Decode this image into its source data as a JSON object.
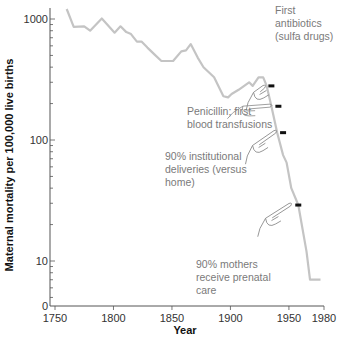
{
  "chart_data": {
    "type": "line",
    "title": "",
    "xlabel": "Year",
    "ylabel": "Maternal mortality per 100,000 live births",
    "yscale": "log",
    "xlim": [
      1750,
      1980
    ],
    "ylim": [
      0,
      1000
    ],
    "x_ticks": [
      1750,
      1800,
      1850,
      1900,
      1950,
      1980
    ],
    "y_ticks": [
      {
        "value": 1000,
        "label": "1000"
      },
      {
        "value": 100,
        "label": "100"
      },
      {
        "value": 10,
        "label": "10"
      },
      {
        "value": 0,
        "label": "0"
      }
    ],
    "grid": false,
    "legend": null,
    "series": [
      {
        "name": "Maternal mortality",
        "color": "#c4c4c4",
        "x": [
          1760,
          1766,
          1775,
          1780,
          1790,
          1801,
          1806,
          1811,
          1815,
          1820,
          1824,
          1829,
          1835,
          1841,
          1851,
          1858,
          1862,
          1866,
          1872,
          1877,
          1886,
          1894,
          1898,
          1901,
          1907,
          1916,
          1919,
          1924,
          1928,
          1931,
          1935,
          1940,
          1945,
          1948,
          1952,
          1958,
          1965,
          1968,
          1977
        ],
        "values": [
          1210,
          860,
          870,
          800,
          1010,
          770,
          870,
          780,
          750,
          650,
          650,
          580,
          510,
          450,
          450,
          540,
          550,
          620,
          480,
          400,
          330,
          230,
          225,
          240,
          260,
          300,
          280,
          330,
          330,
          280,
          190,
          115,
          75,
          65,
          40,
          29,
          12,
          7,
          7
        ]
      }
    ],
    "markers": [
      {
        "year": 1935,
        "value": 280
      },
      {
        "year": 1941,
        "value": 190
      },
      {
        "year": 1945,
        "value": 115
      },
      {
        "year": 1958,
        "value": 29
      }
    ],
    "annotations": [
      {
        "text_lines": [
          "First",
          "antibiotics",
          "(sulfa drugs)"
        ],
        "points_to_year": 1935
      },
      {
        "text_lines": [
          "Penicillin; first",
          "blood transfusions"
        ],
        "points_to_year": 1941
      },
      {
        "text_lines": [
          "90% institutional",
          "deliveries (versus",
          "home)"
        ],
        "points_to_year": 1945
      },
      {
        "text_lines": [
          "90% mothers",
          "receive prenatal",
          "care"
        ],
        "points_to_year": 1958
      }
    ]
  }
}
